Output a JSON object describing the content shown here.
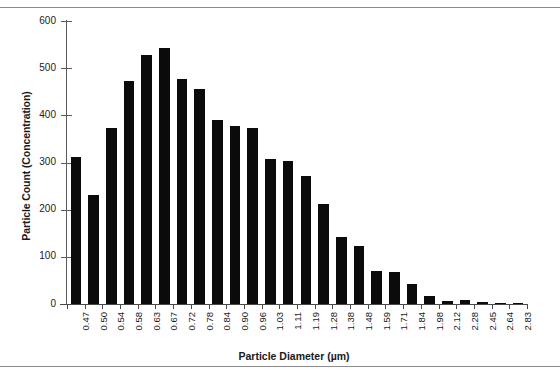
{
  "chart_data": {
    "type": "bar",
    "title": "",
    "xlabel": "Particle Diameter (µm)",
    "ylabel": "Particle Count (Concentration)",
    "categories": [
      "0.47",
      "0.50",
      "0.54",
      "0.58",
      "0.63",
      "0.67",
      "0.72",
      "0.78",
      "0.84",
      "0.90",
      "0.96",
      "1.03",
      "1.11",
      "1.19",
      "1.28",
      "1.38",
      "1.48",
      "1.59",
      "1.71",
      "1.84",
      "1.98",
      "2.12",
      "2.28",
      "2.45",
      "2.64",
      "2.83"
    ],
    "values": [
      312,
      232,
      373,
      472,
      529,
      543,
      478,
      456,
      390,
      378,
      374,
      307,
      303,
      272,
      211,
      143,
      122,
      70,
      68,
      43,
      18,
      7,
      8,
      4,
      3,
      2
    ],
    "ylim": [
      0,
      600
    ],
    "yticks": [
      0,
      100,
      200,
      300,
      400,
      500,
      600
    ],
    "ytick_labels": [
      "0",
      "100",
      "200",
      "300",
      "400",
      "500",
      "600"
    ],
    "grid": false,
    "legend": false,
    "bar_color": "#0b0b0b",
    "axis_color": "#4a4a4a",
    "background": "#ffffff"
  }
}
